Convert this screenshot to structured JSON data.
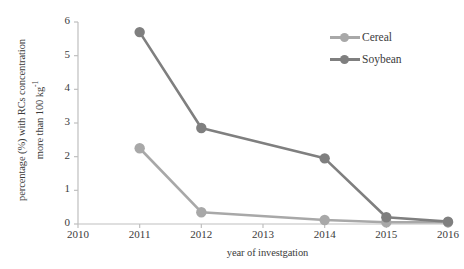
{
  "chart_data": {
    "type": "line",
    "title": "",
    "xlabel": "year of investgation",
    "ylabel_line1": "percentage (%) with RCs concentration",
    "ylabel_line2": "more than 100 kg",
    "ylabel_superscript": "-1",
    "x": [
      2010,
      2011,
      2012,
      2013,
      2014,
      2015,
      2016
    ],
    "xticklabels": [
      "2010",
      "2011",
      "2012",
      "2013",
      "2014",
      "2015",
      "2016"
    ],
    "yticklabels": [
      "0",
      "1",
      "2",
      "3",
      "4",
      "5",
      "6"
    ],
    "xlim": [
      2010,
      2016
    ],
    "ylim": [
      0,
      6
    ],
    "ytick_step": 1,
    "grid": false,
    "legend_position": "top-right",
    "series": [
      {
        "name": "Cereal",
        "color": "#a8a8a8",
        "points": [
          {
            "x": 2011,
            "y": 2.25
          },
          {
            "x": 2012,
            "y": 0.35
          },
          {
            "x": 2014,
            "y": 0.12
          },
          {
            "x": 2015,
            "y": 0.05
          },
          {
            "x": 2016,
            "y": 0.05
          }
        ]
      },
      {
        "name": "Soybean",
        "color": "#7f7f7f",
        "points": [
          {
            "x": 2011,
            "y": 5.7
          },
          {
            "x": 2012,
            "y": 2.85
          },
          {
            "x": 2014,
            "y": 1.95
          },
          {
            "x": 2015,
            "y": 0.2
          },
          {
            "x": 2016,
            "y": 0.07
          }
        ]
      }
    ]
  },
  "axes": {
    "axis_color": "#bfbfbf",
    "text_color": "#3b3b3b"
  },
  "legend": {
    "items": [
      {
        "label": "Cereal",
        "color": "#a8a8a8"
      },
      {
        "label": "Soybean",
        "color": "#7f7f7f"
      }
    ]
  }
}
